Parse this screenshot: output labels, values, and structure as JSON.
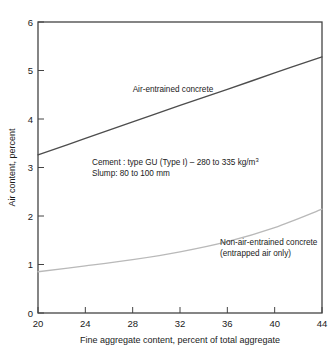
{
  "chart_data": {
    "type": "line",
    "title": "",
    "xlabel": "Fine aggregate content, percent of total aggregate",
    "ylabel": "Air content, percent",
    "xlim": [
      20,
      44
    ],
    "ylim": [
      0,
      6
    ],
    "xticks": [
      "20",
      "24",
      "28",
      "32",
      "36",
      "40",
      "44"
    ],
    "yticks": [
      "0",
      "1",
      "2",
      "3",
      "4",
      "5",
      "6"
    ],
    "xtick_values": [
      20,
      24,
      28,
      32,
      36,
      40,
      44
    ],
    "ytick_values": [
      0,
      1,
      2,
      3,
      4,
      5,
      6
    ],
    "grid": false,
    "legend_position": "inline-annotations",
    "x": [
      20,
      24,
      28,
      32,
      36,
      40,
      44
    ],
    "series": [
      {
        "name": "Air-entrained concrete",
        "color": "#4d4d4d",
        "values": [
          3.26,
          3.6,
          3.94,
          4.28,
          4.61,
          4.95,
          5.28
        ]
      },
      {
        "name": "Non-air-entrained concrete (entrapped air only)",
        "color": "#b9b9b9",
        "values": [
          0.85,
          0.97,
          1.1,
          1.26,
          1.47,
          1.76,
          2.14
        ]
      }
    ],
    "annotations": [
      {
        "id": "air-entrained-label",
        "text": "Air-entrained concrete",
        "x": 28.0,
        "y": 4.56
      },
      {
        "id": "non-air-entrained-label-line1",
        "text": "Non-air-entrained concrete",
        "x": 35.4,
        "y": 1.42
      },
      {
        "id": "non-air-entrained-label-line2",
        "text": "(entrapped air only)",
        "x": 35.4,
        "y": 1.18
      },
      {
        "id": "mix-note-line1-before-sup",
        "text": "Cement : type GU (Type I) – 280 to 335 kg/m",
        "superscript": "3",
        "x": 24.6,
        "y": 3.2
      },
      {
        "id": "mix-note-line2",
        "text": "Slump: 80 to 100 mm",
        "x": 24.6,
        "y": 2.93
      }
    ]
  },
  "labels": {
    "xaxis_title": "Fine aggregate content, percent of total aggregate",
    "yaxis_title": "Air content, percent",
    "series_air_entrained": "Air-entrained concrete",
    "series_non_air_entrained_line1": "Non-air-entrained concrete",
    "series_non_air_entrained_line2": "(entrapped air only)",
    "note_line1": "Cement : type GU (Type I) – 280 to 335 kg/m",
    "note_line1_sup": "3",
    "note_line2": "Slump: 80 to 100 mm",
    "xtick_0": "20",
    "xtick_1": "24",
    "xtick_2": "28",
    "xtick_3": "32",
    "xtick_4": "36",
    "xtick_5": "40",
    "xtick_6": "44",
    "ytick_0": "0",
    "ytick_1": "1",
    "ytick_2": "2",
    "ytick_3": "3",
    "ytick_4": "4",
    "ytick_5": "5",
    "ytick_6": "6"
  },
  "colors": {
    "air_entrained": "#4d4d4d",
    "non_air_entrained": "#b9b9b9",
    "frame": "#444444",
    "background": "#ffffff"
  }
}
